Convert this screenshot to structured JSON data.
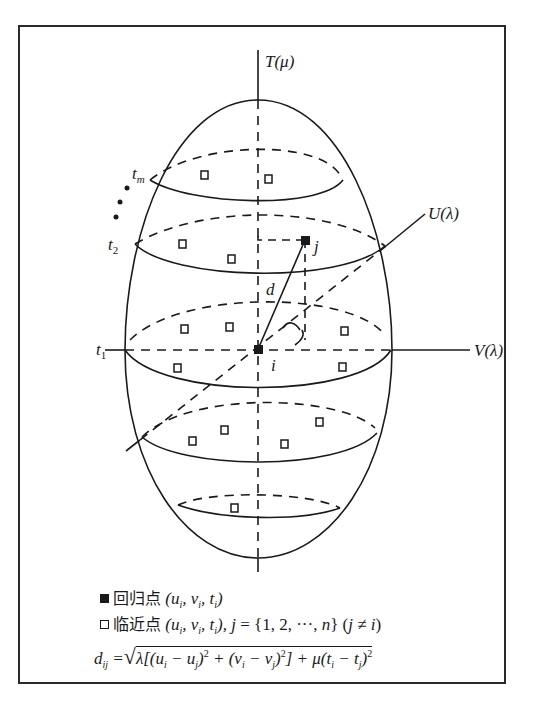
{
  "figure": {
    "type": "3d-ellipsoid-spatiotemporal-neighborhood",
    "axes": {
      "t_axis": "T(μ)",
      "u_axis": "U(λ)",
      "v_axis": "V(λ)"
    },
    "layers": {
      "t_m": "t",
      "t_m_sub": "m",
      "t_2": "t",
      "t_2_sub": "2",
      "t_1": "t",
      "t_1_sub": "1"
    },
    "points": {
      "regression_point_label": "i",
      "neighbor_point_label": "j",
      "distance_label": "d"
    },
    "colors": {
      "line": "#1a1a1a",
      "frame": "#2a2a2a",
      "background": "#ffffff"
    }
  },
  "legend": {
    "regression_point": {
      "symbol": "filled-square",
      "name": "回归点",
      "coords": "(u_i, v_i, t_i)"
    },
    "neighbor_point": {
      "symbol": "hollow-square",
      "name": "临近点",
      "coords": "(u_i, v_i, t_i), j = {1, 2, ···, n} (j ≠ i)"
    },
    "distance_formula": "d_ij = √( λ[(u_i − u_j)² + (v_i − v_j)²] + μ(t_i − t_j)² )"
  }
}
